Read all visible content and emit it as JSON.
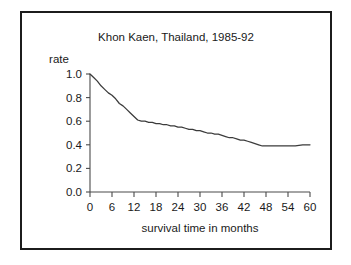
{
  "figure": {
    "border_color": "#1c1c1c",
    "background": "#ffffff"
  },
  "chart_data": {
    "type": "line",
    "title": "Khon Kaen, Thailand, 1985-92",
    "xlabel": "survival time in months",
    "ylabel": "rate",
    "xlim": [
      0,
      60
    ],
    "ylim": [
      0.0,
      1.0
    ],
    "xticks": [
      0,
      6,
      12,
      18,
      24,
      30,
      36,
      42,
      48,
      54,
      60
    ],
    "xtick_labels": [
      "0",
      "6",
      "12",
      "18",
      "24",
      "30",
      "36",
      "42",
      "48",
      "54",
      "60"
    ],
    "yticks": [
      0.0,
      0.2,
      0.4,
      0.6,
      0.8,
      1.0
    ],
    "ytick_labels": [
      "0.0",
      "0.2",
      "0.4",
      "0.6",
      "0.8",
      "1.0"
    ],
    "grid": false,
    "legend": false,
    "line_color": "#3b3b3b",
    "series": [
      {
        "name": "survival rate",
        "x": [
          0,
          1,
          2,
          3,
          4,
          5,
          6,
          7,
          8,
          9,
          10,
          11,
          12,
          13,
          14,
          15,
          16,
          17,
          18,
          19,
          20,
          21,
          22,
          23,
          24,
          25,
          26,
          27,
          28,
          29,
          30,
          31,
          32,
          33,
          34,
          35,
          36,
          37,
          38,
          39,
          40,
          41,
          42,
          43,
          44,
          45,
          46,
          47,
          48,
          50,
          52,
          54,
          56,
          58,
          60
        ],
        "y": [
          1.0,
          0.97,
          0.94,
          0.9,
          0.87,
          0.84,
          0.82,
          0.79,
          0.75,
          0.73,
          0.7,
          0.67,
          0.64,
          0.61,
          0.6,
          0.6,
          0.59,
          0.59,
          0.58,
          0.58,
          0.57,
          0.57,
          0.56,
          0.56,
          0.55,
          0.55,
          0.54,
          0.53,
          0.53,
          0.52,
          0.52,
          0.51,
          0.5,
          0.5,
          0.49,
          0.49,
          0.48,
          0.47,
          0.46,
          0.46,
          0.45,
          0.44,
          0.44,
          0.43,
          0.42,
          0.41,
          0.4,
          0.39,
          0.39,
          0.39,
          0.39,
          0.39,
          0.39,
          0.4,
          0.4
        ]
      }
    ]
  }
}
